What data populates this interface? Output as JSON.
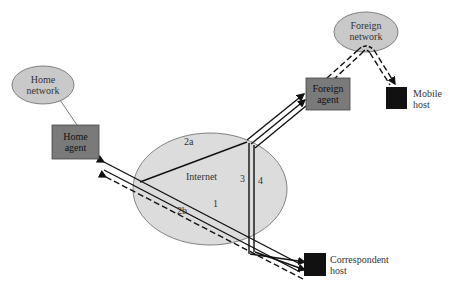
{
  "diagram": {
    "nodes": {
      "home_network": {
        "label_line1": "Home",
        "label_line2": "network",
        "shape": "ellipse",
        "fill": "#c9c9c9"
      },
      "home_agent": {
        "label_line1": "Home",
        "label_line2": "agent",
        "shape": "rect",
        "fill": "#7a7a7a"
      },
      "internet": {
        "label": "Internet",
        "shape": "ellipse",
        "fill": "#dcdcdc"
      },
      "foreign_network": {
        "label_line1": "Foreign",
        "label_line2": "network",
        "shape": "ellipse",
        "fill": "#c9c9c9"
      },
      "foreign_agent": {
        "label_line1": "Foreign",
        "label_line2": "agent",
        "shape": "rect",
        "fill": "#7a7a7a"
      },
      "mobile_host": {
        "label_line1": "Mobile",
        "label_line2": "host",
        "shape": "rect",
        "fill": "#111111"
      },
      "correspondent_host": {
        "label_line1": "Correspondent",
        "label_line2": "host",
        "shape": "rect",
        "fill": "#111111"
      }
    },
    "path_labels": {
      "p1": "1",
      "p2a": "2a",
      "p2b": "2b",
      "p3": "3",
      "p4": "4"
    }
  }
}
